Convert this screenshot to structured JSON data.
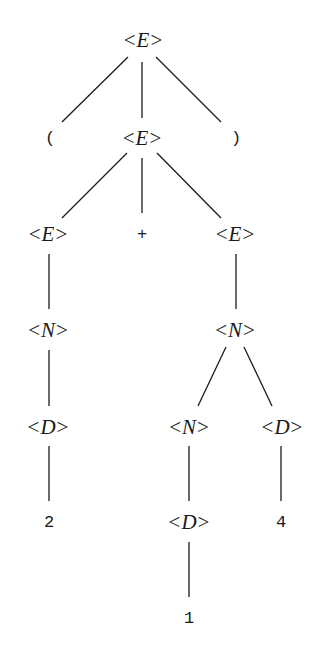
{
  "diagram": {
    "type": "parse-tree",
    "expression": "(2+14)",
    "nodes": [
      {
        "id": "n0",
        "kind": "nonterminal",
        "symbol": "E",
        "left": "<",
        "right": ">",
        "x": 143,
        "y": 40
      },
      {
        "id": "n1",
        "kind": "terminal",
        "label": "(",
        "x": 50,
        "y": 138
      },
      {
        "id": "n2",
        "kind": "nonterminal",
        "symbol": "E",
        "left": "<",
        "right": ">",
        "x": 142,
        "y": 138
      },
      {
        "id": "n3",
        "kind": "terminal",
        "label": ")",
        "x": 236,
        "y": 138
      },
      {
        "id": "n4",
        "kind": "nonterminal",
        "symbol": "E",
        "left": "<",
        "right": ">",
        "x": 48,
        "y": 234
      },
      {
        "id": "n5",
        "kind": "terminal",
        "label": "+",
        "x": 142,
        "y": 234
      },
      {
        "id": "n6",
        "kind": "nonterminal",
        "symbol": "E",
        "left": "<",
        "right": ">",
        "x": 235,
        "y": 234
      },
      {
        "id": "n7",
        "kind": "nonterminal",
        "symbol": "N",
        "left": "<",
        "right": ">",
        "x": 48,
        "y": 330
      },
      {
        "id": "n8",
        "kind": "nonterminal",
        "symbol": "N",
        "left": "<",
        "right": ">",
        "x": 235,
        "y": 330
      },
      {
        "id": "n9",
        "kind": "nonterminal",
        "symbol": "D",
        "left": "<",
        "right": ">",
        "x": 48,
        "y": 427
      },
      {
        "id": "n10",
        "kind": "nonterminal",
        "symbol": "N",
        "left": "<",
        "right": ">",
        "x": 189,
        "y": 427
      },
      {
        "id": "n11",
        "kind": "nonterminal",
        "symbol": "D",
        "left": "<",
        "right": ">",
        "x": 282,
        "y": 427
      },
      {
        "id": "n12",
        "kind": "terminal",
        "label": "2",
        "x": 49,
        "y": 522
      },
      {
        "id": "n13",
        "kind": "nonterminal",
        "symbol": "D",
        "left": "<",
        "right": ">",
        "x": 189,
        "y": 522
      },
      {
        "id": "n14",
        "kind": "terminal",
        "label": "4",
        "x": 281,
        "y": 522
      },
      {
        "id": "n15",
        "kind": "terminal",
        "label": "1",
        "x": 189,
        "y": 618
      }
    ],
    "edges": [
      {
        "from": "n0",
        "to": "n1",
        "x1": 128,
        "y1": 57,
        "x2": 62,
        "y2": 122
      },
      {
        "from": "n0",
        "to": "n2",
        "x1": 142,
        "y1": 62,
        "x2": 142,
        "y2": 118
      },
      {
        "from": "n0",
        "to": "n3",
        "x1": 156,
        "y1": 57,
        "x2": 221,
        "y2": 122
      },
      {
        "from": "n2",
        "to": "n4",
        "x1": 127,
        "y1": 153,
        "x2": 62,
        "y2": 218
      },
      {
        "from": "n2",
        "to": "n5",
        "x1": 142,
        "y1": 158,
        "x2": 142,
        "y2": 213
      },
      {
        "from": "n2",
        "to": "n6",
        "x1": 157,
        "y1": 153,
        "x2": 221,
        "y2": 218
      },
      {
        "from": "n4",
        "to": "n7",
        "x1": 49,
        "y1": 254,
        "x2": 49,
        "y2": 309
      },
      {
        "from": "n6",
        "to": "n8",
        "x1": 236,
        "y1": 254,
        "x2": 236,
        "y2": 309
      },
      {
        "from": "n7",
        "to": "n9",
        "x1": 49,
        "y1": 350,
        "x2": 49,
        "y2": 406
      },
      {
        "from": "n8",
        "to": "n10",
        "x1": 226,
        "y1": 347,
        "x2": 198,
        "y2": 406
      },
      {
        "from": "n8",
        "to": "n11",
        "x1": 244,
        "y1": 347,
        "x2": 272,
        "y2": 406
      },
      {
        "from": "n9",
        "to": "n12",
        "x1": 49,
        "y1": 446,
        "x2": 49,
        "y2": 501
      },
      {
        "from": "n10",
        "to": "n13",
        "x1": 189,
        "y1": 446,
        "x2": 189,
        "y2": 501
      },
      {
        "from": "n11",
        "to": "n14",
        "x1": 281,
        "y1": 446,
        "x2": 281,
        "y2": 501
      },
      {
        "from": "n13",
        "to": "n15",
        "x1": 189,
        "y1": 542,
        "x2": 189,
        "y2": 597
      }
    ],
    "colors": {
      "background": "#ffffff",
      "ink": "#1a1a1a"
    }
  }
}
